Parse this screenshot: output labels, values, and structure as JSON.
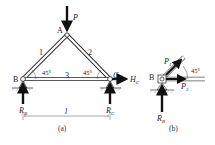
{
  "figure_a": {
    "caption": "(a)",
    "nodes": {
      "A": "A",
      "B": "B",
      "C": "C"
    },
    "members": {
      "m1": "1",
      "m2": "2",
      "m3": "3"
    },
    "angles": {
      "left": "45°",
      "right": "45°"
    },
    "load": {
      "label": "P"
    },
    "reactions": {
      "RB": {
        "main": "R",
        "sub": "B"
      },
      "RC": {
        "main": "R",
        "sub": "C"
      },
      "HC": {
        "main": "H",
        "sub": "C"
      }
    },
    "span": "l"
  },
  "figure_b": {
    "caption": "(b)",
    "node": "B",
    "angle": "45°",
    "forces": {
      "P1": {
        "main": "P",
        "sub": "1"
      },
      "P3": {
        "main": "P",
        "sub": "3"
      },
      "RB": {
        "main": "R",
        "sub": "B"
      }
    }
  },
  "colors": {
    "line": "#222222",
    "member_fill": "#ffffff",
    "hatch": "#888888"
  }
}
